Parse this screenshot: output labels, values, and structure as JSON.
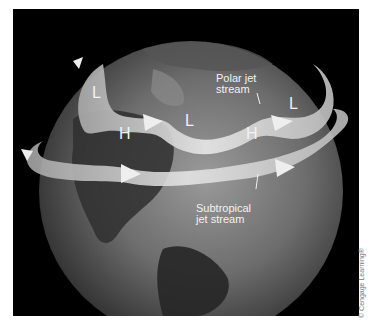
{
  "figure": {
    "colors": {
      "background": "#000000",
      "page": "#ffffff",
      "arrow": "#d9d9d9",
      "label": "#f2f2f2"
    },
    "pressure_labels": [
      {
        "text": "L",
        "id": "low-west"
      },
      {
        "text": "H",
        "id": "high-west"
      },
      {
        "text": "L",
        "id": "low-center"
      },
      {
        "text": "H",
        "id": "high-east"
      },
      {
        "text": "L",
        "id": "low-east"
      }
    ],
    "polar_jet": {
      "line1": "Polar jet",
      "line2": "stream"
    },
    "subtropical_jet": {
      "line1": "Subtropical",
      "line2": "jet stream"
    },
    "copyright": "© Cengage Learning®"
  }
}
